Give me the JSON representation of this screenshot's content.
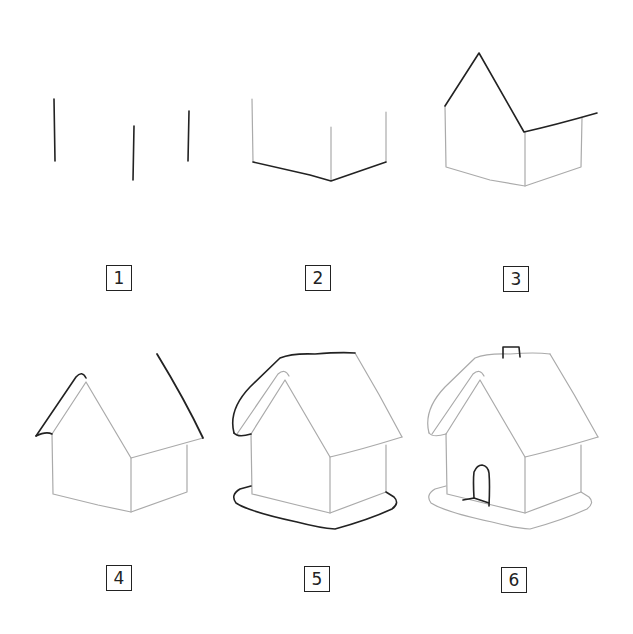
{
  "steps": [
    {
      "number": "1",
      "description": "Three vertical lines"
    },
    {
      "number": "2",
      "description": "Base lines connecting walls"
    },
    {
      "number": "3",
      "description": "Gable roof outline and right eave"
    },
    {
      "number": "4",
      "description": "Thick roof edge and right roof slope"
    },
    {
      "number": "5",
      "description": "Roof top and ground base"
    },
    {
      "number": "6",
      "description": "Chimney and arched door"
    }
  ],
  "colors": {
    "ink_dark": "#222222",
    "ink_light": "#9a9a9a",
    "background": "#ffffff"
  }
}
